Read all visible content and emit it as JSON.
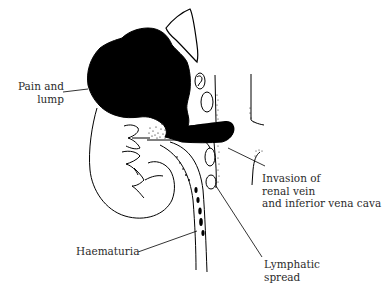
{
  "figure": {
    "colors": {
      "background": "#ffffff",
      "ink": "#000000",
      "label_text": "#2b2b2b"
    },
    "labels": {
      "pain_lump": [
        "Pain and",
        "lump"
      ],
      "invasion": [
        "Invasion of",
        "renal vein",
        "and inferior vena cava"
      ],
      "lymphatic": [
        "Lymphatic",
        "spread"
      ],
      "haematuria": [
        "Haematuria"
      ]
    },
    "structures": [
      "kidney-outline",
      "tumour-mass",
      "adrenal-gland",
      "renal-vein-tumour-thrombus",
      "inferior-vena-cava",
      "aorta-wall",
      "lymph-nodes",
      "ureter",
      "blood-clots-in-ureter",
      "renal-calyces"
    ]
  }
}
